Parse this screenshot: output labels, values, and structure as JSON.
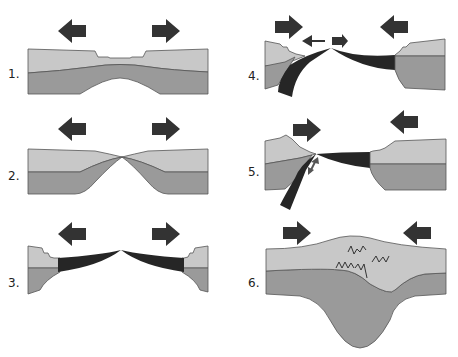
{
  "diagram": {
    "type": "plate-tectonics-stages",
    "colors": {
      "crust": "#c8c8c8",
      "mantle": "#9a9a9a",
      "oceanic_crust": "#262626",
      "arrow": "#333333",
      "outline": "#555555"
    },
    "panels": [
      {
        "label": "1.",
        "arrows": [
          "left",
          "right"
        ],
        "description": "continental rifting"
      },
      {
        "label": "2.",
        "arrows": [
          "left",
          "right"
        ],
        "description": "crust thins to a point"
      },
      {
        "label": "3.",
        "arrows": [
          "left",
          "right"
        ],
        "description": "new oceanic crust forms between continents"
      },
      {
        "label": "4.",
        "arrows": [
          "right",
          "left",
          "small-left",
          "small-right"
        ],
        "description": "subduction begins"
      },
      {
        "label": "5.",
        "arrows": [
          "right",
          "left",
          "double-small"
        ],
        "description": "ocean closes, subduction"
      },
      {
        "label": "6.",
        "arrows": [
          "right",
          "left"
        ],
        "description": "continental collision with mountain root"
      }
    ]
  }
}
